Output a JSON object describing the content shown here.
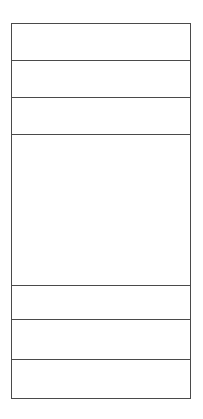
{
  "layout": {
    "rows": [
      {
        "id": "row-1",
        "label": "",
        "height": 37
      },
      {
        "id": "row-2",
        "label": "",
        "height": 37
      },
      {
        "id": "row-3",
        "label": "",
        "height": 37
      },
      {
        "id": "row-4",
        "label": "",
        "height": 151
      },
      {
        "id": "row-5",
        "label": "",
        "height": 34
      },
      {
        "id": "row-6",
        "label": "",
        "height": 40
      },
      {
        "id": "row-7",
        "label": "",
        "height": 38
      }
    ]
  },
  "colors": {
    "border": "#4a4a4a",
    "background": "#ffffff"
  }
}
